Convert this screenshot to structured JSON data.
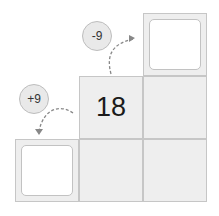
{
  "puzzle": {
    "center_value": "18",
    "operations": [
      {
        "label": "-9",
        "direction": "up-right"
      },
      {
        "label": "+9",
        "direction": "down-left"
      }
    ],
    "blank_cells": [
      "top-right",
      "bottom-left"
    ]
  }
}
